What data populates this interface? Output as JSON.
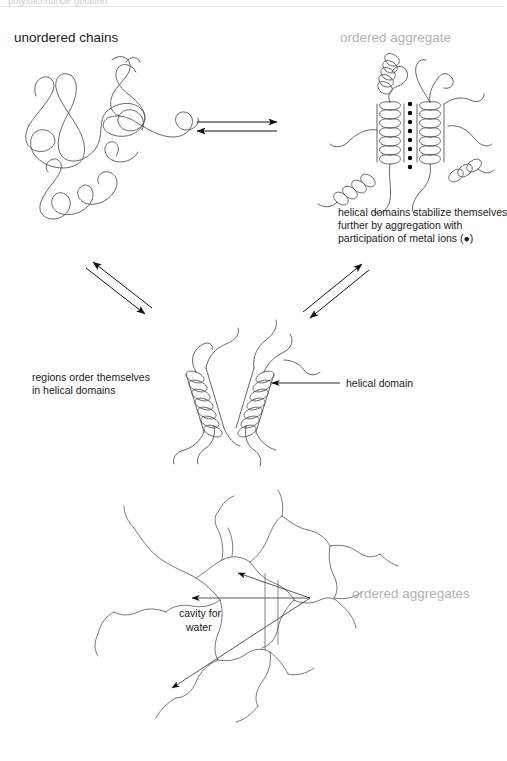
{
  "figure": {
    "title_top_clipped": "polysaccharide gelation",
    "labels": {
      "unordered_chains": "unordered chains",
      "ordered_aggregate": "ordered aggregate",
      "ordered_aggregates": "ordered aggregates",
      "helical_domain": "helical domain",
      "cavity_for_water_line1": "cavity for",
      "cavity_for_water_line2": "water",
      "regions_order_line1": "regions order themselves",
      "regions_order_line2": "in helical domains",
      "metal_ions_line1": "helical domains stabilize themselves",
      "metal_ions_line2": "further by aggregation with",
      "metal_ions_line3": "participation of metal ions (●)"
    },
    "colors": {
      "stroke": "#4a4a4a",
      "text_dark": "#1a1a1a",
      "text_gray": "#b3b3b3",
      "ion_dot": "#000000",
      "arrow": "#111111",
      "background": "#ffffff"
    },
    "counts": {
      "metal_ion_dots": 8,
      "equilibrium_arrow_pairs": 3,
      "network_arrows": 3
    },
    "icons": {
      "equilibrium": "double-arrow-icon",
      "pointer": "arrow-icon",
      "ion": "filled-circle-icon"
    }
  }
}
